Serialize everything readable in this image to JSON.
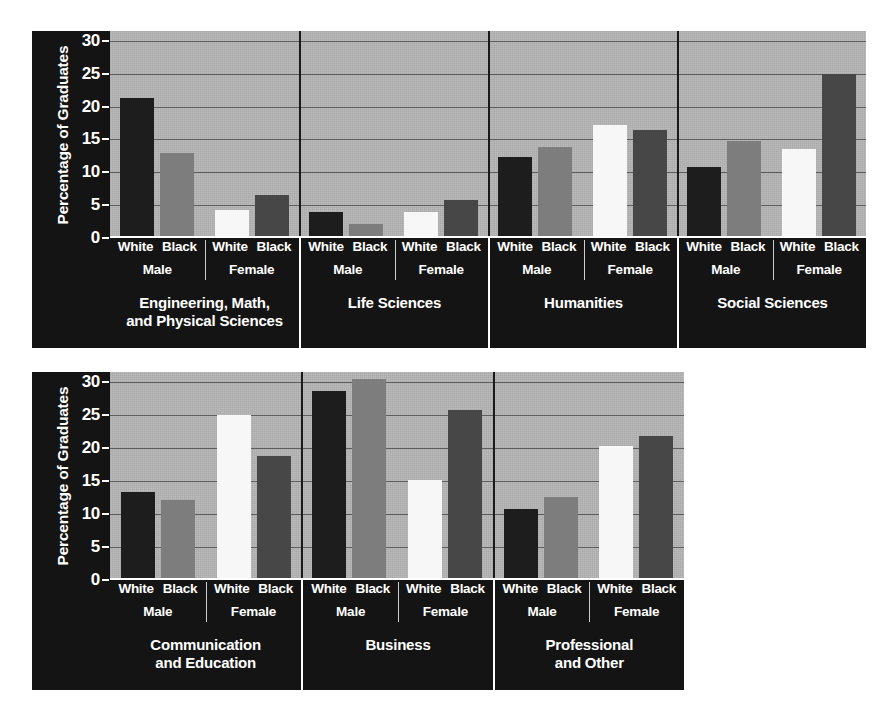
{
  "chart_data": [
    {
      "type": "bar",
      "id": "top",
      "title": "",
      "xlabel": "",
      "ylabel": "Percentage of Graduates",
      "ylim": [
        0,
        31.5
      ],
      "yticks": [
        0,
        5,
        10,
        15,
        20,
        25,
        30
      ],
      "ytick_labels": [
        "0",
        "5",
        "10",
        "15",
        "20",
        "25",
        "30"
      ],
      "grid": true,
      "legend": "none",
      "categories": [
        "White Male",
        "Black Male",
        "White Female",
        "Black Female"
      ],
      "series_labels": [
        "White",
        "Black",
        "White",
        "Black"
      ],
      "sex_labels": [
        "Male",
        "Female"
      ],
      "groups": [
        {
          "label": "Engineering, Math,\nand Physical Sciences",
          "label_lines": [
            "Engineering, Math,",
            "and Physical Sciences"
          ],
          "values": [
            21.3,
            13.0,
            4.3,
            6.6
          ]
        },
        {
          "label": "Life Sciences",
          "label_lines": [
            "Life Sciences"
          ],
          "values": [
            3.9,
            2.2,
            3.9,
            5.8
          ]
        },
        {
          "label": "Humanities",
          "label_lines": [
            "Humanities"
          ],
          "values": [
            12.3,
            13.9,
            17.2,
            16.5
          ]
        },
        {
          "label": "Social Sciences",
          "label_lines": [
            "Social Sciences"
          ],
          "values": [
            10.8,
            14.7,
            13.5,
            24.9
          ]
        }
      ]
    },
    {
      "type": "bar",
      "id": "bottom",
      "title": "",
      "xlabel": "",
      "ylabel": "Percentage of Graduates",
      "ylim": [
        0,
        31.5
      ],
      "yticks": [
        0,
        5,
        10,
        15,
        20,
        25,
        30
      ],
      "ytick_labels": [
        "0",
        "5",
        "10",
        "15",
        "20",
        "25",
        "30"
      ],
      "grid": true,
      "legend": "none",
      "categories": [
        "White Male",
        "Black Male",
        "White Female",
        "Black Female"
      ],
      "series_labels": [
        "White",
        "Black",
        "White",
        "Black"
      ],
      "sex_labels": [
        "Male",
        "Female"
      ],
      "groups": [
        {
          "label": "Communication\nand Education",
          "label_lines": [
            "Communication",
            "and Education"
          ],
          "values": [
            13.4,
            12.1,
            25.0,
            18.8
          ]
        },
        {
          "label": "Business",
          "label_lines": [
            "Business"
          ],
          "values": [
            28.7,
            30.5,
            15.2,
            25.8
          ]
        },
        {
          "label": "Professional\nand Other",
          "label_lines": [
            "Professional",
            "and Other"
          ],
          "values": [
            10.8,
            12.5,
            20.3,
            21.8
          ]
        }
      ]
    }
  ],
  "colors": {
    "bar_white_male": "#1d1d1d",
    "bar_black_male": "#7d7d7d",
    "bar_white_female": "#f7f7f7",
    "bar_black_female": "#474747",
    "plot_background": "#b6b6b6",
    "panel_background": "#141414",
    "gridline": "#5e5e5e",
    "text": "#ffffff",
    "page_background": "#ffffff"
  }
}
